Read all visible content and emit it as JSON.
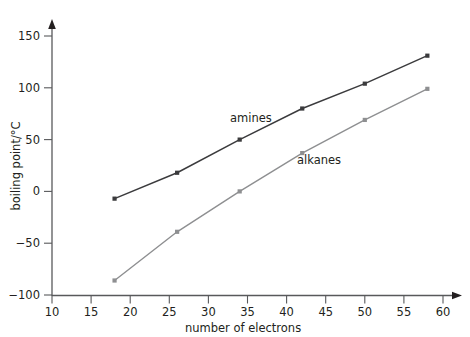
{
  "chart_data": {
    "type": "line",
    "title": "",
    "xlabel": "number of electrons",
    "ylabel": "boiling point/°C",
    "xlim": [
      10,
      63
    ],
    "ylim": [
      -100,
      160
    ],
    "xticks": [
      10,
      15,
      20,
      25,
      30,
      35,
      40,
      45,
      50,
      55,
      60
    ],
    "xtick_labels": [
      "10",
      "15",
      "20",
      "25",
      "30",
      "35",
      "40",
      "45",
      "50",
      "55",
      "60"
    ],
    "yticks": [
      -100,
      -50,
      0,
      50,
      100,
      150
    ],
    "ytick_labels": [
      "−100",
      "−50",
      "0",
      "50",
      "100",
      "150"
    ],
    "grid": false,
    "legend_position": "inline-annotations",
    "x": [
      18,
      26,
      34,
      42,
      50,
      58
    ],
    "series": [
      {
        "name": "amines",
        "color": "#3b3b3d",
        "marker": "square",
        "values": [
          -7,
          18,
          50,
          80,
          104,
          131
        ]
      },
      {
        "name": "alkanes",
        "color": "#8e8f91",
        "marker": "square",
        "values": [
          -86,
          -39,
          0,
          37,
          69,
          99
        ]
      }
    ],
    "annotations": [
      {
        "text": "amines",
        "x": 30.5,
        "y": 68
      },
      {
        "text": "alkanes",
        "x": 40.0,
        "y": 30
      }
    ]
  },
  "axes": {
    "x_axis_title": "number of electrons",
    "y_axis_title": "boiling point/°C",
    "x_tick_labels": [
      "10",
      "15",
      "20",
      "25",
      "30",
      "35",
      "40",
      "45",
      "50",
      "55",
      "60"
    ],
    "y_tick_labels": [
      "150",
      "100",
      "50",
      "0",
      "−50",
      "−100"
    ]
  },
  "labels": {
    "amines": "amines",
    "alkanes": "alkanes"
  },
  "colors": {
    "amines_line": "#3b3b3d",
    "alkanes_line": "#8e8f91",
    "axis": "#58595b",
    "text": "#231f20",
    "background": "#ffffff"
  }
}
